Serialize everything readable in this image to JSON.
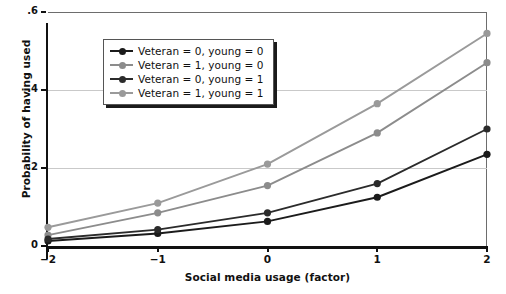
{
  "chart_data": {
    "type": "line",
    "title": "",
    "xlabel": "Social media usage (factor)",
    "ylabel": "Probability of having used",
    "x": [
      -2,
      -1,
      0,
      1,
      2
    ],
    "xlim": [
      -2,
      2
    ],
    "ylim": [
      0,
      0.6
    ],
    "xticks": [
      "−2",
      "−1",
      "0",
      "1",
      "2"
    ],
    "yticks": [
      "0",
      ".2",
      ".4",
      ".6"
    ],
    "ytick_values": [
      0,
      0.2,
      0.4,
      0.6
    ],
    "grid": "horizontal",
    "legend_position": "upper-left-inside",
    "series": [
      {
        "name": "Veteran = 0, young = 0",
        "color": "#1b1b1b",
        "values": [
          0.013,
          0.032,
          0.063,
          0.125,
          0.235
        ]
      },
      {
        "name": "Veteran = 1, young = 0",
        "color": "#8c8c8c",
        "values": [
          0.028,
          0.085,
          0.155,
          0.29,
          0.47
        ]
      },
      {
        "name": "Veteran = 0, young = 1",
        "color": "#2b2b2b",
        "values": [
          0.018,
          0.042,
          0.085,
          0.16,
          0.3
        ]
      },
      {
        "name": "Veteran = 1, young = 1",
        "color": "#9a9a9a",
        "values": [
          0.048,
          0.11,
          0.21,
          0.365,
          0.545
        ]
      }
    ]
  }
}
